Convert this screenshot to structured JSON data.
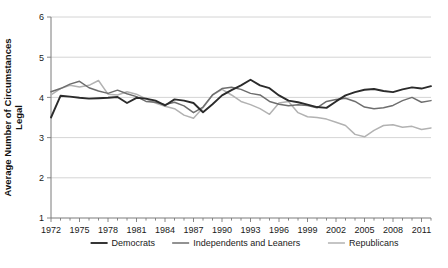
{
  "chart_data": {
    "type": "line",
    "title": "",
    "xlabel": "",
    "ylabel": "Average Number of Circumstances Legal",
    "ylabel_lines": [
      "Average Number of Circumstances",
      "Legal"
    ],
    "ylim": [
      1,
      6
    ],
    "yticks": [
      1,
      2,
      3,
      4,
      5,
      6
    ],
    "ytick_labels": [
      "1",
      "2",
      "3",
      "4",
      "5",
      "6"
    ],
    "xlim": [
      1972,
      2012
    ],
    "xticks": [
      1972,
      1975,
      1978,
      1981,
      1984,
      1987,
      1990,
      1993,
      1996,
      1999,
      2002,
      2005,
      2008,
      2011
    ],
    "xtick_labels": [
      "1972",
      "1975",
      "1978",
      "1981",
      "1984",
      "1987",
      "1990",
      "1993",
      "1996",
      "1999",
      "2002",
      "2005",
      "2008",
      "2011"
    ],
    "grid": true,
    "grid_axis": "y",
    "legend_position": "bottom",
    "x": [
      1972,
      1973,
      1974,
      1975,
      1976,
      1977,
      1978,
      1979,
      1980,
      1981,
      1982,
      1983,
      1984,
      1985,
      1986,
      1987,
      1988,
      1989,
      1990,
      1991,
      1992,
      1993,
      1994,
      1995,
      1996,
      1997,
      1998,
      1999,
      2000,
      2001,
      2002,
      2003,
      2004,
      2005,
      2006,
      2007,
      2008,
      2009,
      2010,
      2011,
      2012
    ],
    "series": [
      {
        "name": "Democrats",
        "color": "#2b2b2b",
        "width": 1.9,
        "values": [
          3.5,
          4.04,
          4.02,
          3.99,
          3.97,
          3.98,
          3.99,
          4.01,
          3.86,
          3.99,
          3.97,
          3.92,
          3.8,
          3.95,
          3.92,
          3.86,
          3.63,
          3.83,
          4.05,
          4.18,
          4.3,
          4.44,
          4.3,
          4.23,
          4.05,
          3.92,
          3.88,
          3.82,
          3.76,
          3.74,
          3.9,
          4.05,
          4.13,
          4.19,
          4.21,
          4.16,
          4.13,
          4.2,
          4.25,
          4.22,
          4.28
        ]
      },
      {
        "name": "Independents and Leaners",
        "color": "#6e6e6e",
        "width": 1.5,
        "values": [
          4.14,
          4.22,
          4.33,
          4.4,
          4.24,
          4.16,
          4.1,
          4.18,
          4.09,
          4.02,
          3.9,
          3.88,
          3.82,
          3.88,
          3.79,
          3.62,
          3.76,
          4.06,
          4.22,
          4.25,
          4.2,
          4.1,
          4.06,
          3.9,
          3.83,
          3.79,
          3.82,
          3.8,
          3.74,
          3.9,
          3.95,
          3.98,
          3.9,
          3.76,
          3.72,
          3.74,
          3.8,
          3.92,
          4.0,
          3.88,
          3.92
        ]
      },
      {
        "name": "Republicans",
        "color": "#b2b2b2",
        "width": 1.5,
        "values": [
          4.06,
          4.22,
          4.3,
          4.26,
          4.3,
          4.42,
          4.08,
          4.06,
          4.14,
          4.08,
          3.96,
          3.86,
          3.78,
          3.72,
          3.56,
          3.48,
          3.74,
          4.06,
          4.2,
          4.06,
          3.9,
          3.82,
          3.72,
          3.58,
          3.86,
          3.9,
          3.62,
          3.52,
          3.5,
          3.46,
          3.38,
          3.3,
          3.08,
          3.02,
          3.18,
          3.3,
          3.32,
          3.26,
          3.28,
          3.2,
          3.24
        ]
      }
    ],
    "legend": [
      {
        "label": "Democrats",
        "color": "#2b2b2b"
      },
      {
        "label": "Independents and Leaners",
        "color": "#6e6e6e"
      },
      {
        "label": "Republicans",
        "color": "#b2b2b2"
      }
    ]
  }
}
